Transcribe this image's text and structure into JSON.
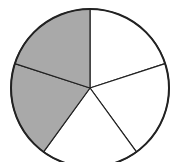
{
  "chart_data": {
    "type": "pie",
    "title": "",
    "total_parts": 5,
    "shaded_parts": 2,
    "values": [
      1,
      1,
      1,
      1,
      1
    ],
    "shaded": [
      false,
      false,
      false,
      true,
      true
    ],
    "colors": {
      "shaded": "#a9a9a9",
      "unshaded": "#ffffff",
      "stroke": "#222222"
    },
    "start_angle_deg": -90
  }
}
